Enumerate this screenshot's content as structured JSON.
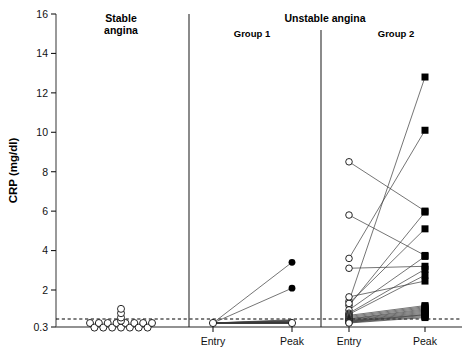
{
  "figure": {
    "background": "#ffffff",
    "line_color": "#3a3a3a",
    "marker_color": "#000000"
  },
  "axes": {
    "y_title": "CRP (mg/dl)",
    "y_ticks": [
      "0.3",
      "2",
      "4",
      "6",
      "8",
      "10",
      "12",
      "14",
      "16"
    ],
    "y_tick_values": [
      0.3,
      2,
      4,
      6,
      8,
      10,
      12,
      14,
      16
    ],
    "y_min": 0.3,
    "y_max": 16,
    "threshold_value": 0.3,
    "threshold_style": "dashed",
    "grid": "off"
  },
  "panels": {
    "stable_title_line1": "Stable",
    "stable_title_line2": "angina",
    "unstable_title": "Unstable angina",
    "group1_title": "Group 1",
    "group2_title": "Group 2"
  },
  "x_labels": {
    "group1_entry": "Entry",
    "group1_peak": "Peak",
    "group2_entry": "Entry",
    "group2_peak": "Peak"
  },
  "chart_data": {
    "type": "scatter",
    "title": "",
    "subtitle": "",
    "xlabel": "",
    "ylabel": "CRP (mg/dl)",
    "ylim": [
      0.3,
      16
    ],
    "grid": false,
    "legend": "none",
    "y_ticks": [
      0.3,
      2,
      4,
      6,
      8,
      10,
      12,
      14,
      16
    ],
    "reference_line": {
      "y": 0.3,
      "style": "dashed",
      "label": "0.3"
    },
    "panels": [
      {
        "name": "Stable angina",
        "plot_type": "scatter",
        "marker": "open-circle",
        "x_categories": [],
        "note": "single column of individual patient values, jittered",
        "values": [
          0.3,
          0.3,
          0.3,
          0.3,
          0.3,
          0.3,
          0.3,
          0.3,
          0.3,
          0.3,
          0.32,
          0.32,
          0.32,
          0.32,
          0.35,
          0.4,
          0.55,
          0.75,
          0.95
        ]
      },
      {
        "name": "Unstable angina - Group 1",
        "plot_type": "paired-line",
        "entry_marker": "open-circle",
        "peak_marker": "filled-circle",
        "x_categories": [
          "Entry",
          "Peak"
        ],
        "pairs": [
          {
            "entry": 0.3,
            "peak": 3.2
          },
          {
            "entry": 0.3,
            "peak": 1.9
          },
          {
            "entry": 0.3,
            "peak": 0.45
          },
          {
            "entry": 0.3,
            "peak": 0.42
          },
          {
            "entry": 0.3,
            "peak": 0.4
          },
          {
            "entry": 0.3,
            "peak": 0.38
          },
          {
            "entry": 0.3,
            "peak": 0.36
          },
          {
            "entry": 0.3,
            "peak": 0.34
          },
          {
            "entry": 0.3,
            "peak": 0.33
          },
          {
            "entry": 0.3,
            "peak": 0.32
          },
          {
            "entry": 0.3,
            "peak": 0.31
          },
          {
            "entry": 0.3,
            "peak": 0.3
          },
          {
            "entry": 0.3,
            "peak": 0.3
          },
          {
            "entry": 0.3,
            "peak": 0.3
          },
          {
            "entry": 0.3,
            "peak": 0.3
          },
          {
            "entry": 0.3,
            "peak": 0.3
          },
          {
            "entry": 0.3,
            "peak": 0.3
          },
          {
            "entry": 0.3,
            "peak": 0.3
          }
        ]
      },
      {
        "name": "Unstable angina - Group 2",
        "plot_type": "paired-line",
        "entry_marker": "open-circle",
        "peak_marker": "filled-square",
        "x_categories": [
          "Entry",
          "Peak"
        ],
        "pairs": [
          {
            "entry": 1.3,
            "peak": 12.6
          },
          {
            "entry": 3.4,
            "peak": 9.9
          },
          {
            "entry": 8.3,
            "peak": 5.8
          },
          {
            "entry": 1.1,
            "peak": 5.75
          },
          {
            "entry": 1.2,
            "peak": 4.9
          },
          {
            "entry": 5.6,
            "peak": 3.55
          },
          {
            "entry": 0.9,
            "peak": 3.5
          },
          {
            "entry": 2.9,
            "peak": 3.0
          },
          {
            "entry": 0.75,
            "peak": 2.85
          },
          {
            "entry": 0.7,
            "peak": 2.55
          },
          {
            "entry": 1.5,
            "peak": 2.25
          },
          {
            "entry": 0.65,
            "peak": 1.1
          },
          {
            "entry": 0.6,
            "peak": 1.05
          },
          {
            "entry": 0.55,
            "peak": 1.0
          },
          {
            "entry": 0.5,
            "peak": 0.95
          },
          {
            "entry": 0.48,
            "peak": 0.9
          },
          {
            "entry": 0.45,
            "peak": 0.85
          },
          {
            "entry": 0.42,
            "peak": 0.8
          },
          {
            "entry": 0.4,
            "peak": 0.75
          },
          {
            "entry": 0.38,
            "peak": 0.7
          },
          {
            "entry": 0.36,
            "peak": 0.68
          },
          {
            "entry": 0.34,
            "peak": 0.65
          },
          {
            "entry": 0.32,
            "peak": 0.6
          },
          {
            "entry": 0.3,
            "peak": 0.55
          }
        ]
      }
    ]
  }
}
